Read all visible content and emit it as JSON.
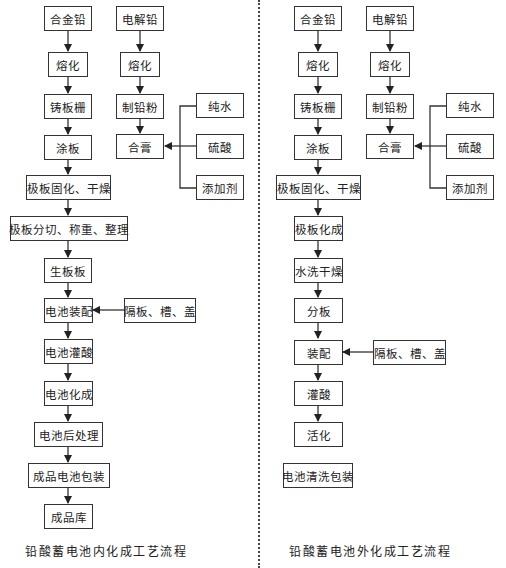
{
  "left": {
    "title": "铅酸蓄电池内化成工艺流程",
    "boxes": {
      "alloy_lead": "合金铅",
      "electrolytic_lead": "电解铅",
      "melt_a": "熔化",
      "melt_b": "熔化",
      "cast_grid": "铸板栅",
      "make_lead_powder": "制铅粉",
      "pure_water": "纯水",
      "paste_plate": "涂板",
      "mix_paste": "合膏",
      "sulfuric_acid": "硫酸",
      "additive": "添加剂",
      "cure_dry": "极板固化、干燥",
      "cut_weigh_sort": "极板分切、称重、整理",
      "raw_plate": "生板板",
      "battery_assembly": "电池装配",
      "separator_case_lid": "隔板、槽、盖",
      "acid_filling": "电池灌酸",
      "formation": "电池化成",
      "post_treatment": "电池后处理",
      "packaging": "成品电池包装",
      "warehouse": "成品库"
    }
  },
  "right": {
    "title": "铅酸蓄电池外化成工艺流程",
    "boxes": {
      "alloy_lead": "合金铅",
      "electrolytic_lead": "电解铅",
      "melt_a": "熔化",
      "melt_b": "熔化",
      "cast_grid": "铸板栅",
      "make_lead_powder": "制铅粉",
      "pure_water": "纯水",
      "paste_plate": "涂板",
      "mix_paste": "合膏",
      "sulfuric_acid": "硫酸",
      "additive": "添加剂",
      "cure_dry": "极板固化、干燥",
      "plate_formation": "极板化成",
      "wash_dry": "水洗干燥",
      "split_plate": "分板",
      "assembly": "装配",
      "separator_case_lid": "隔板、槽、盖",
      "acid_filling": "灌酸",
      "activation": "活化",
      "clean_pack": "电池清洗包装"
    }
  }
}
